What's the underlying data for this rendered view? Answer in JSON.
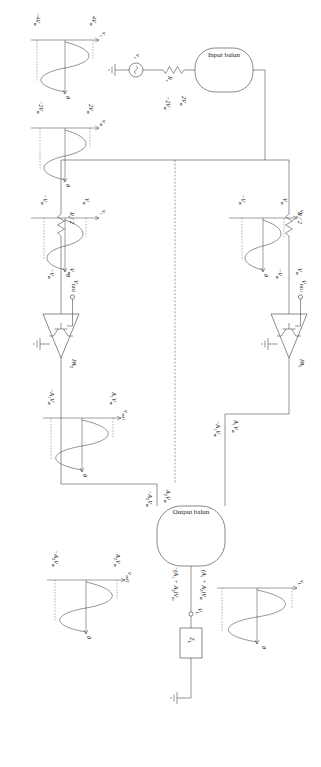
{
  "diagram": {
    "blocks": {
      "input_balun": "Input balun",
      "output_balun": "Output balun",
      "pa1": "PA",
      "pa1_sub": "1",
      "pa2": "PA",
      "pa2_sub": "2"
    },
    "components": {
      "source": "v",
      "source_sub": "s",
      "rs": "R",
      "rs_sub": "s",
      "rs_half_top": "R",
      "rs_half_top_sub": "s",
      "rs_half_top_den": "/ 2",
      "rs_half_bot": "R",
      "rs_half_bot_sub": "s",
      "rs_half_bot_den": "/ 2",
      "zl": "Z",
      "zl_sub": "L",
      "vl": "V",
      "vl_sub": "L",
      "vdd1": "V",
      "vdd1_sub": "DD1",
      "vdd2": "V",
      "vdd2_sub": "DD2"
    },
    "node_expressions": {
      "vin_2vm": "2V",
      "vin_2vm_sub": "m",
      "vin_neg2vm": "−2V",
      "vin_neg2vm_sub": "m",
      "in1_vm": "V",
      "in1_vm_sub": "m",
      "in1_negvm": "−V",
      "in1_negvm_sub": "m",
      "in2_vm": "V",
      "in2_vm_sub": "m",
      "in2_negvm": "−V",
      "in2_negvm_sub": "m",
      "out1_a1vm": "A",
      "out1_a1vm_sub": "1",
      "out1_a1vm_tail": "V",
      "out1_a1vm_tail_sub": "m",
      "out1_nega1vm": "−A",
      "out1_nega1vm_sub": "1",
      "out1_nega1vm_tail": "V",
      "out1_nega1vm_tail_sub": "m",
      "out2_a2vm": "A",
      "out2_a2vm_sub": "2",
      "out2_a2vm_tail": "V",
      "out2_a2vm_tail_sub": "m",
      "out2_nega2vm": "−A",
      "out2_nega2vm_sub": "2",
      "out2_nega2vm_tail": "V",
      "out2_nega2vm_tail_sub": "m",
      "load_sum": "(A",
      "load_sum_sub1": "1",
      "load_sum_mid": " + A",
      "load_sum_sub2": "2",
      "load_sum_tail": ")V",
      "load_sum_tail_sub": "m",
      "load_negsum": "−(A",
      "load_negsum_sub1": "1",
      "load_negsum_mid": " + A",
      "load_negsum_sub2": "2",
      "load_negsum_tail": ")V",
      "load_negsum_tail_sub": "m"
    },
    "waveforms": [
      {
        "id": "wave-source",
        "y_label": "v",
        "y_label_sub": "s",
        "x_label": "θ",
        "amp_top": "4V",
        "amp_top_sub": "m",
        "amp_bot": "−4V",
        "amp_bot_sub": "m"
      },
      {
        "id": "wave-balun-input",
        "y_label": "v",
        "y_label_sub": "in",
        "x_label": "θ",
        "amp_top": "2V",
        "amp_top_sub": "m",
        "amp_bot": "−2V",
        "amp_bot_sub": "m"
      },
      {
        "id": "wave-branch-1",
        "y_label": "v",
        "y_label_sub": "1",
        "x_label": "θ",
        "amp_top": "V",
        "amp_top_sub": "m",
        "amp_bot": "−V",
        "amp_bot_sub": "m"
      },
      {
        "id": "wave-branch-2",
        "y_label": "v",
        "y_label_sub": "2",
        "x_label": "θ",
        "amp_top": "V",
        "amp_top_sub": "m",
        "amp_bot": "−V",
        "amp_bot_sub": "m"
      },
      {
        "id": "wave-out-1",
        "y_label": "v",
        "y_label_sub": "out1",
        "x_label": "θ",
        "amp_top": "A",
        "amp_top_sub": "1",
        "amp_top_tail": "V",
        "amp_top_tail_sub": "m",
        "amp_bot": "−A",
        "amp_bot_sub": "1",
        "amp_bot_tail": "V",
        "amp_bot_tail_sub": "m"
      },
      {
        "id": "wave-out-2",
        "y_label": "v",
        "y_label_sub": "out2",
        "x_label": "θ",
        "amp_top": "A",
        "amp_top_sub": "2",
        "amp_top_tail": "V",
        "amp_top_tail_sub": "m",
        "amp_bot": "−A",
        "amp_bot_sub": "2",
        "amp_bot_tail": "V",
        "amp_bot_tail_sub": "m"
      },
      {
        "id": "wave-load",
        "y_label": "v",
        "y_label_sub": "L",
        "x_label": "θ",
        "amp_top": "(A",
        "amp_bot": "−(A"
      }
    ]
  }
}
